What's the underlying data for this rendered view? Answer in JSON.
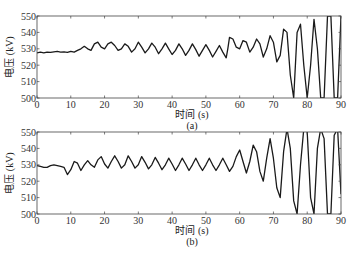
{
  "chart_data": [
    {
      "type": "line",
      "panel_label": "(a)",
      "title": "",
      "xlabel": "时间 (s)",
      "ylabel": "电压 (kV)",
      "xlim": [
        0,
        90
      ],
      "ylim": [
        500,
        550
      ],
      "xticks": [
        0,
        10,
        20,
        30,
        40,
        50,
        60,
        70,
        80,
        90
      ],
      "yticks": [
        500,
        510,
        520,
        530,
        540,
        550
      ],
      "grid": false,
      "series": [
        {
          "name": "voltage",
          "x": [
            0,
            1,
            2,
            3,
            4,
            5,
            6,
            7,
            8,
            9,
            10,
            11,
            12,
            13,
            14,
            15,
            16,
            17,
            18,
            19,
            20,
            21,
            22,
            23,
            24,
            25,
            26,
            27,
            28,
            29,
            30,
            31,
            32,
            33,
            34,
            35,
            36,
            37,
            38,
            39,
            40,
            41,
            42,
            43,
            44,
            45,
            46,
            47,
            48,
            49,
            50,
            51,
            52,
            53,
            54,
            55,
            56,
            56.5,
            57,
            58,
            59,
            60,
            61,
            62,
            63,
            64,
            65,
            66,
            67,
            68,
            69,
            70,
            71,
            72,
            73,
            74,
            75,
            76,
            77,
            78,
            79,
            80,
            81,
            82,
            83,
            84,
            85,
            86,
            87,
            88,
            89,
            90
          ],
          "values": [
            527.5,
            528,
            527.5,
            528,
            527.8,
            528.2,
            528.5,
            528,
            528.2,
            527.8,
            528.5,
            528,
            529,
            530,
            531.5,
            530,
            529,
            533,
            534,
            531,
            530,
            533,
            534,
            532,
            529,
            530,
            533,
            531.5,
            528,
            530,
            534,
            531,
            527.5,
            530,
            533.5,
            531,
            527,
            530,
            533.5,
            530,
            526.5,
            529,
            533,
            530,
            526,
            529,
            533,
            529.5,
            525.5,
            529,
            532.5,
            529,
            525,
            528.5,
            532,
            528,
            524.5,
            530,
            537,
            536,
            531,
            530,
            535,
            534,
            528,
            531,
            536,
            533,
            525,
            530,
            538,
            534,
            522,
            526,
            542,
            540,
            514,
            500,
            540,
            545,
            520,
            500,
            520,
            548,
            530,
            500,
            500,
            550,
            550,
            500,
            500,
            550,
            550,
            500
          ]
        }
      ]
    },
    {
      "type": "line",
      "panel_label": "(b)",
      "title": "",
      "xlabel": "时间 (s)",
      "ylabel": "电压 (kV)",
      "xlim": [
        0,
        90
      ],
      "ylim": [
        500,
        550
      ],
      "xticks": [
        0,
        10,
        20,
        30,
        40,
        50,
        60,
        70,
        80,
        90
      ],
      "yticks": [
        500,
        510,
        520,
        530,
        540,
        550
      ],
      "grid": false,
      "series": [
        {
          "name": "voltage",
          "x": [
            0,
            1,
            2,
            3,
            4,
            5,
            6,
            7,
            8,
            9,
            10,
            11,
            12,
            13,
            14,
            15,
            16,
            17,
            18,
            19,
            20,
            21,
            22,
            23,
            24,
            25,
            26,
            27,
            28,
            29,
            30,
            31,
            32,
            33,
            34,
            35,
            36,
            37,
            38,
            39,
            40,
            41,
            42,
            43,
            44,
            45,
            46,
            47,
            48,
            49,
            50,
            51,
            52,
            53,
            54,
            55,
            56,
            57,
            58,
            59,
            60,
            61,
            62,
            63,
            64,
            65,
            66,
            67,
            68,
            69,
            70,
            71,
            72,
            73,
            74,
            75,
            76,
            77,
            78,
            79,
            80,
            81,
            82,
            83,
            84,
            85,
            86,
            87,
            88,
            89,
            90
          ],
          "values": [
            529.5,
            529,
            528.5,
            528.5,
            529.5,
            530,
            529.5,
            529,
            528.5,
            524,
            527,
            532,
            531,
            526.5,
            530,
            532.5,
            530,
            528.5,
            533,
            535,
            530.5,
            528,
            532,
            535.5,
            532,
            528,
            530,
            535.5,
            532,
            528,
            530,
            535,
            531.5,
            527.5,
            530,
            534.5,
            531,
            527,
            530,
            534,
            530.5,
            526.5,
            530,
            534,
            530.5,
            526.5,
            530,
            534,
            530,
            526.5,
            530,
            534,
            530,
            526.5,
            530,
            534,
            530,
            526,
            529,
            535,
            539,
            532,
            525,
            532,
            542,
            538,
            526,
            520,
            534,
            546,
            534,
            516,
            510,
            538,
            552,
            540,
            508,
            500,
            530,
            552,
            550,
            510,
            500,
            540,
            552,
            546,
            500,
            500,
            548,
            552,
            512
          ]
        }
      ]
    }
  ],
  "panels": [
    {
      "caption": "(a)",
      "xlabel": "时间 (s)",
      "ylabel": "电压 (kV)"
    },
    {
      "caption": "(b)",
      "xlabel": "时间 (s)",
      "ylabel": "电压 (kV)"
    }
  ]
}
